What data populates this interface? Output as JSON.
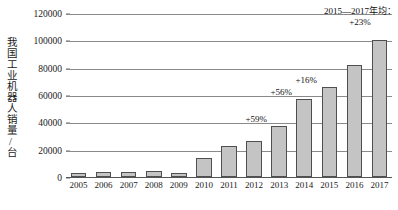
{
  "chart_data": {
    "type": "bar",
    "title": "",
    "xlabel": "",
    "ylabel": "我国工业机器人销量/台",
    "categories": [
      "2005",
      "2006",
      "2007",
      "2008",
      "2009",
      "2010",
      "2011",
      "2012",
      "2013",
      "2014",
      "2015",
      "2016",
      "2017"
    ],
    "values": [
      3000,
      3500,
      3500,
      4500,
      3000,
      14000,
      22500,
      26000,
      37000,
      57000,
      66000,
      82000,
      100000
    ],
    "ylim": [
      0,
      120000
    ],
    "ytick_labels": [
      "0",
      "20000",
      "40000",
      "60000",
      "80000",
      "100000",
      "120000"
    ],
    "ytick_values": [
      0,
      20000,
      40000,
      60000,
      80000,
      100000,
      120000
    ],
    "grid": true,
    "legend": "none",
    "bar_fill_color": "#c4c4c4",
    "bar_border_color": "#4f4f4f",
    "annotations": [
      {
        "name": "growth-2013",
        "text": "+59%",
        "category": "2013"
      },
      {
        "name": "growth-2014",
        "text": "+56%",
        "category": "2014"
      },
      {
        "name": "growth-2015",
        "text": "+16%",
        "category": "2015"
      },
      {
        "name": "average-2015-2017-line1",
        "text": "2015—2017年均：",
        "category": "2017"
      },
      {
        "name": "average-2015-2017-line2",
        "text": "+23%",
        "category": "2017"
      }
    ]
  }
}
